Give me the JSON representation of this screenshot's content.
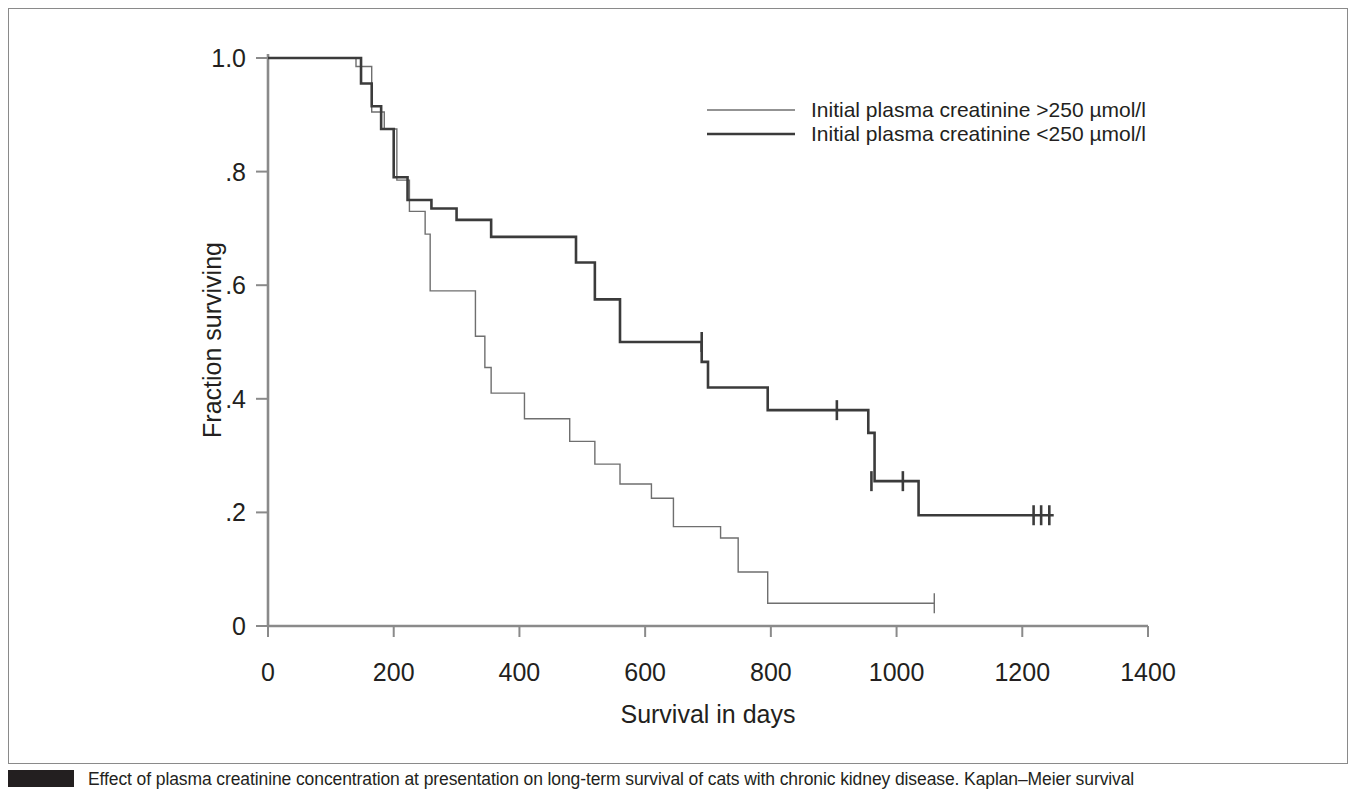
{
  "figure": {
    "caption_text": "Effect of plasma creatinine concentration at presentation on long-term survival of cats with chronic kidney disease. Kaplan–Meier survival",
    "caption_swatch_color": "#231f20",
    "frame_color": "#8a8a8a",
    "background": "#ffffff"
  },
  "chart_data": {
    "type": "line",
    "subtype": "kaplan-meier-step",
    "title": "",
    "xlabel": "Survival in days",
    "ylabel": "Fraction surviving",
    "xlim": [
      0,
      1400
    ],
    "ylim": [
      0,
      1.0
    ],
    "xticks": [
      0,
      200,
      400,
      600,
      800,
      1000,
      1200,
      1400
    ],
    "xticklabels": [
      "0",
      "200",
      "400",
      "600",
      "800",
      "1000",
      "1200",
      "1400"
    ],
    "yticks": [
      0,
      0.2,
      0.4,
      0.6,
      0.8,
      1.0
    ],
    "yticklabels": [
      "0",
      ".2",
      ".4",
      ".6",
      ".8",
      "1.0"
    ],
    "grid": false,
    "legend_position": "top-right",
    "series": [
      {
        "name": "Initial plasma creatinine >250 µmol/l",
        "line_width": 1.4,
        "color": "#6f6f6f",
        "steps": [
          [
            0,
            1.0
          ],
          [
            140,
            1.0
          ],
          [
            140,
            0.985
          ],
          [
            165,
            0.985
          ],
          [
            165,
            0.905
          ],
          [
            185,
            0.905
          ],
          [
            185,
            0.875
          ],
          [
            205,
            0.875
          ],
          [
            205,
            0.785
          ],
          [
            225,
            0.785
          ],
          [
            225,
            0.73
          ],
          [
            250,
            0.73
          ],
          [
            250,
            0.69
          ],
          [
            258,
            0.69
          ],
          [
            258,
            0.59
          ],
          [
            330,
            0.59
          ],
          [
            330,
            0.51
          ],
          [
            345,
            0.51
          ],
          [
            345,
            0.455
          ],
          [
            355,
            0.455
          ],
          [
            355,
            0.41
          ],
          [
            408,
            0.41
          ],
          [
            408,
            0.365
          ],
          [
            480,
            0.365
          ],
          [
            480,
            0.325
          ],
          [
            520,
            0.325
          ],
          [
            520,
            0.285
          ],
          [
            560,
            0.285
          ],
          [
            560,
            0.25
          ],
          [
            610,
            0.25
          ],
          [
            610,
            0.225
          ],
          [
            645,
            0.225
          ],
          [
            645,
            0.175
          ],
          [
            720,
            0.175
          ],
          [
            720,
            0.155
          ],
          [
            748,
            0.155
          ],
          [
            748,
            0.095
          ],
          [
            795,
            0.095
          ],
          [
            795,
            0.04
          ],
          [
            1060,
            0.04
          ]
        ],
        "censor_marks": [
          [
            1060,
            0.04
          ]
        ]
      },
      {
        "name": "Initial plasma creatinine <250 µmol/l",
        "line_width": 2.6,
        "color": "#3b3b3b",
        "steps": [
          [
            0,
            1.0
          ],
          [
            148,
            1.0
          ],
          [
            148,
            0.955
          ],
          [
            165,
            0.955
          ],
          [
            165,
            0.915
          ],
          [
            180,
            0.915
          ],
          [
            180,
            0.875
          ],
          [
            200,
            0.875
          ],
          [
            200,
            0.79
          ],
          [
            222,
            0.79
          ],
          [
            222,
            0.75
          ],
          [
            260,
            0.75
          ],
          [
            260,
            0.735
          ],
          [
            300,
            0.735
          ],
          [
            300,
            0.715
          ],
          [
            355,
            0.715
          ],
          [
            355,
            0.685
          ],
          [
            490,
            0.685
          ],
          [
            490,
            0.64
          ],
          [
            520,
            0.64
          ],
          [
            520,
            0.575
          ],
          [
            560,
            0.575
          ],
          [
            560,
            0.5
          ],
          [
            690,
            0.5
          ],
          [
            690,
            0.465
          ],
          [
            700,
            0.465
          ],
          [
            700,
            0.42
          ],
          [
            795,
            0.42
          ],
          [
            795,
            0.38
          ],
          [
            955,
            0.38
          ],
          [
            955,
            0.34
          ],
          [
            965,
            0.34
          ],
          [
            965,
            0.255
          ],
          [
            1035,
            0.255
          ],
          [
            1035,
            0.195
          ],
          [
            1250,
            0.195
          ]
        ],
        "censor_marks": [
          [
            690,
            0.5
          ],
          [
            905,
            0.38
          ],
          [
            960,
            0.255
          ],
          [
            1010,
            0.255
          ],
          [
            1218,
            0.195
          ],
          [
            1230,
            0.195
          ],
          [
            1243,
            0.195
          ]
        ]
      }
    ]
  },
  "legend": {
    "entries": [
      {
        "label": "Initial plasma creatinine >250 µmol/l",
        "line_width": 1.4,
        "color": "#6f6f6f"
      },
      {
        "label": "Initial plasma creatinine <250 µmol/l",
        "line_width": 2.6,
        "color": "#3b3b3b"
      }
    ]
  }
}
